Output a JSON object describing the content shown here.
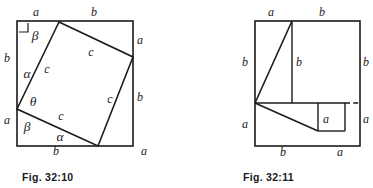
{
  "page": {
    "background": "#ffffff",
    "ink": "#1a1a1a",
    "width": 373,
    "height": 188
  },
  "figures": [
    {
      "id": "fig-32-10",
      "caption": "Fig. 32:10",
      "description": "Outer square with an inscribed tilted square forming four congruent right triangles",
      "outer_square": {
        "x1": 17,
        "y1": 21,
        "x2": 133,
        "y2": 146
      },
      "inner_square_vertices": [
        {
          "name": "top",
          "x": 59,
          "y": 22
        },
        {
          "name": "right",
          "x": 133,
          "y": 57
        },
        {
          "name": "bottom",
          "x": 98,
          "y": 146
        },
        {
          "name": "left",
          "x": 17,
          "y": 109
        }
      ],
      "right_angle_marker": {
        "x": 19,
        "y": 23,
        "size": 9
      },
      "side_labels": [
        {
          "text": "a",
          "x": 36,
          "y": 16,
          "side": "top-left"
        },
        {
          "text": "b",
          "x": 94,
          "y": 16,
          "side": "top-right"
        },
        {
          "text": "a",
          "x": 140,
          "y": 44,
          "side": "right-upper"
        },
        {
          "text": "b",
          "x": 140,
          "y": 101,
          "side": "right-lower"
        },
        {
          "text": "a",
          "x": 144,
          "y": 155,
          "side": "bottom-right"
        },
        {
          "text": "b",
          "x": 56,
          "y": 155,
          "side": "bottom-left"
        },
        {
          "text": "a",
          "x": 7,
          "y": 124,
          "side": "left-lower"
        },
        {
          "text": "b",
          "x": 7,
          "y": 62,
          "side": "left-upper"
        }
      ],
      "hypotenuse_labels": [
        {
          "text": "c",
          "x": 47,
          "y": 73
        },
        {
          "text": "c",
          "x": 91,
          "y": 56
        },
        {
          "text": "c",
          "x": 110,
          "y": 103
        },
        {
          "text": "c",
          "x": 61,
          "y": 120
        }
      ],
      "angle_labels": [
        {
          "text": "β",
          "x": 35,
          "y": 40,
          "name": "beta-top"
        },
        {
          "text": "α",
          "x": 27,
          "y": 78,
          "name": "alpha-left"
        },
        {
          "text": "θ",
          "x": 33,
          "y": 106,
          "name": "theta"
        },
        {
          "text": "β",
          "x": 27,
          "y": 131,
          "name": "beta-bottom"
        },
        {
          "text": "α",
          "x": 60,
          "y": 141,
          "name": "alpha-bottom"
        }
      ]
    },
    {
      "id": "fig-32-11",
      "caption": "Fig. 32:11",
      "description": "Outer square dissected into squares and triangles showing the a-b rearrangement",
      "outer_square": {
        "x1": 255,
        "y1": 21,
        "x2": 360,
        "y2": 146
      },
      "divider_y": 103,
      "divider_solid_x2": 345,
      "vertical_top": {
        "x": 292,
        "y1": 21,
        "y2": 103
      },
      "small_square": {
        "x1": 318,
        "y1": 103,
        "x2": 345,
        "y2": 131
      },
      "dashed_segment": {
        "x1": 345,
        "y1": 103,
        "x2": 360,
        "y2": 103
      },
      "diagonals": [
        {
          "x1": 255,
          "y1": 103,
          "x2": 292,
          "y2": 21
        },
        {
          "x1": 255,
          "y1": 103,
          "x2": 318,
          "y2": 131
        }
      ],
      "labels": [
        {
          "text": "a",
          "x": 271,
          "y": 16,
          "name": "top-a"
        },
        {
          "text": "b",
          "x": 322,
          "y": 16,
          "name": "top-b"
        },
        {
          "text": "b",
          "x": 245,
          "y": 66,
          "name": "left-b"
        },
        {
          "text": "a",
          "x": 245,
          "y": 128,
          "name": "left-a"
        },
        {
          "text": "b",
          "x": 299,
          "y": 66,
          "name": "mid-b"
        },
        {
          "text": "b",
          "x": 366,
          "y": 66,
          "name": "right-b"
        },
        {
          "text": "a",
          "x": 366,
          "y": 123,
          "name": "right-a"
        },
        {
          "text": "a",
          "x": 326,
          "y": 123,
          "name": "square-a"
        },
        {
          "text": "b",
          "x": 283,
          "y": 156,
          "name": "bottom-b"
        },
        {
          "text": "a",
          "x": 340,
          "y": 156,
          "name": "bottom-a"
        }
      ]
    }
  ],
  "captions": [
    {
      "text": "Fig. 32:10",
      "x": 22,
      "y": 181
    },
    {
      "text": "Fig. 32:11",
      "x": 243,
      "y": 181
    }
  ]
}
